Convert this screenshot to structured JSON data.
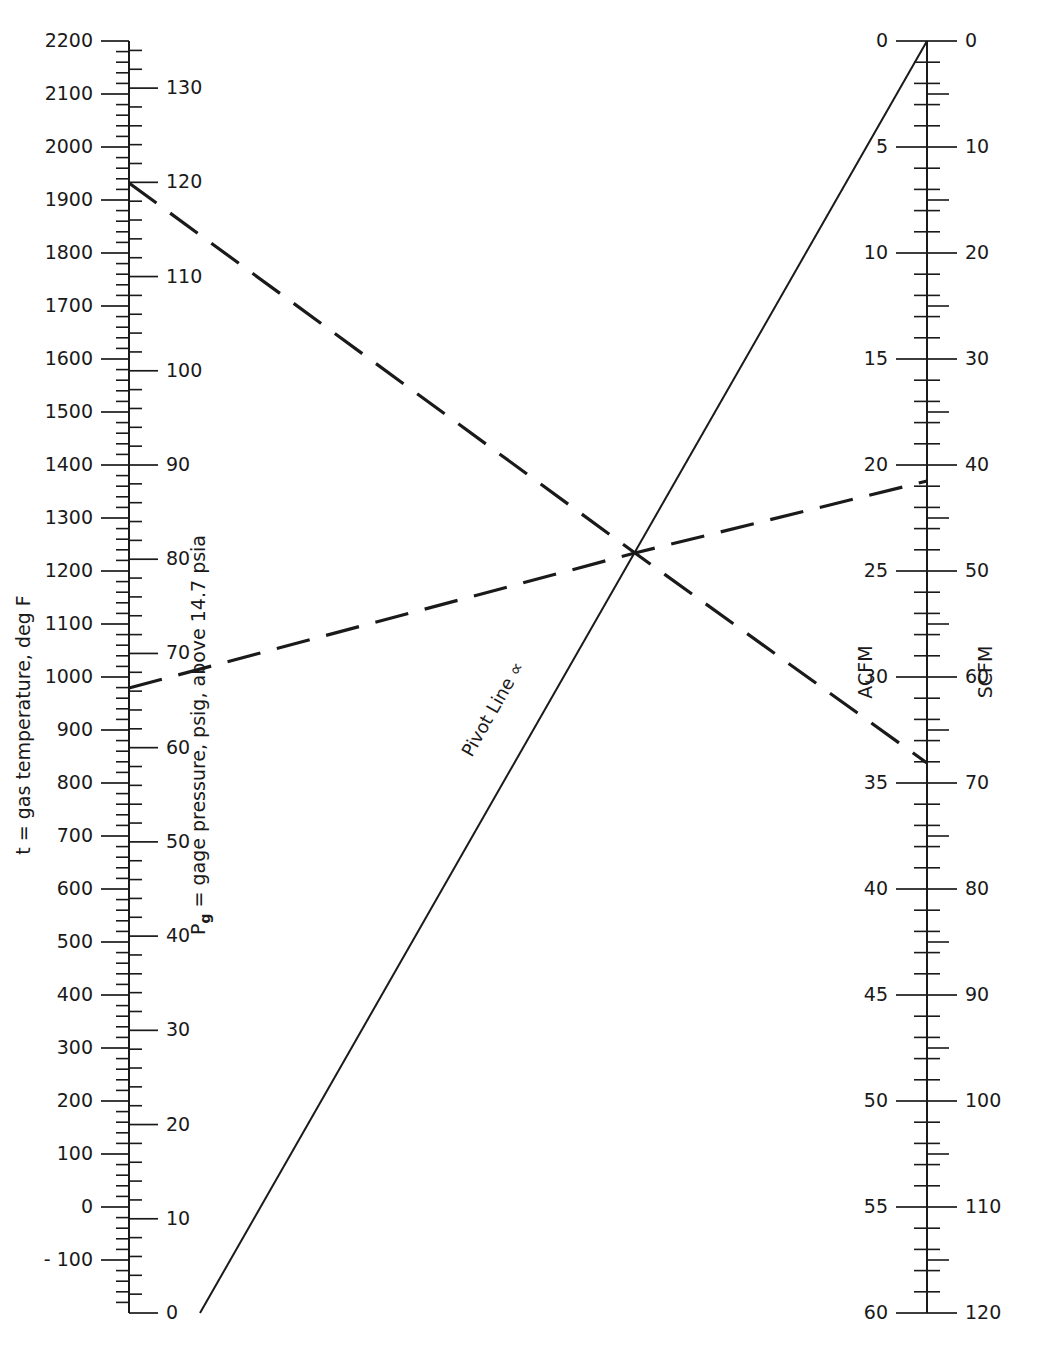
{
  "figure": {
    "kind": "nomogram",
    "background": "#ffffff",
    "ink": "#1a1a1a"
  },
  "chart_data": {
    "type": "line",
    "title": "",
    "subtitle": "",
    "xlabel": "",
    "ylabel": "",
    "grid": false,
    "legend": "none",
    "axes": [
      {
        "id": "temperature",
        "name": "t = gas temperature, deg F",
        "short": "t",
        "units": "deg F",
        "side": "left-of-left-spine",
        "orientation": "vertical",
        "min": -200,
        "max": 2200,
        "ylim": [
          -200,
          2200
        ],
        "major_step": 100,
        "minor_step": 20,
        "ticks": [
          2200,
          2100,
          2000,
          1900,
          1800,
          1700,
          1600,
          1500,
          1400,
          1300,
          1200,
          1100,
          1000,
          900,
          800,
          700,
          600,
          500,
          400,
          300,
          200,
          100,
          0,
          -100
        ],
        "tick_labels": [
          "2200",
          "2100",
          "2000",
          "1900",
          "1800",
          "1700",
          "1600",
          "1500",
          "1400",
          "1300",
          "1200",
          "1100",
          "1000",
          "900",
          "800",
          "700",
          "600",
          "500",
          "400",
          "300",
          "200",
          "100",
          "0",
          "- 100"
        ]
      },
      {
        "id": "pressure",
        "name": "Pg = gage pressure, psig, above 14.7 psia",
        "name_base": "P",
        "name_sub": "g",
        "name_rest": " = gage pressure, psig, above 14.7 psia",
        "short": "Pg",
        "units": "psig",
        "side": "right-of-left-spine",
        "orientation": "vertical",
        "min": 0,
        "max": 135,
        "ylim": [
          0,
          135
        ],
        "major_step": 10,
        "minor_step": 2,
        "ticks": [
          130,
          120,
          110,
          100,
          90,
          80,
          70,
          60,
          50,
          40,
          30,
          20,
          10,
          0
        ],
        "tick_labels": [
          "130",
          "120",
          "110",
          "100",
          "90",
          "80",
          "70",
          "60",
          "50",
          "40",
          "30",
          "20",
          "10",
          "0"
        ]
      },
      {
        "id": "acfm",
        "name": "ACFM",
        "units": "ACFM",
        "side": "left-of-right-spine",
        "orientation": "vertical",
        "min": 0,
        "max": 60,
        "ylim": [
          0,
          60
        ],
        "major_step": 5,
        "minor_step": 1,
        "ticks": [
          0,
          5,
          10,
          15,
          20,
          25,
          30,
          35,
          40,
          45,
          50,
          55,
          60
        ],
        "tick_labels": [
          "0",
          "5",
          "10",
          "15",
          "20",
          "25",
          "30",
          "35",
          "40",
          "45",
          "50",
          "55",
          "60"
        ]
      },
      {
        "id": "scfm",
        "name": "SCFM",
        "units": "SCFM",
        "side": "right-of-right-spine",
        "orientation": "vertical",
        "min": 0,
        "max": 120,
        "ylim": [
          0,
          120
        ],
        "major_step": 10,
        "minor_step": 2,
        "ticks": [
          0,
          10,
          20,
          30,
          40,
          50,
          60,
          70,
          80,
          90,
          100,
          110,
          120
        ],
        "tick_labels": [
          "0",
          "10",
          "20",
          "30",
          "40",
          "50",
          "60",
          "70",
          "80",
          "90",
          "100",
          "110",
          "120"
        ]
      }
    ],
    "series": [
      {
        "name": "Pivot Line",
        "label": "Pivot Line ∝",
        "label_text": "Pivot Line",
        "label_symbol": "∝",
        "style": "solid",
        "points": [
          {
            "x": 200,
            "y": 1313
          },
          {
            "x": 927,
            "y": 41
          }
        ]
      },
      {
        "name": "Example construction line 1 (descending)",
        "label": "",
        "style": "dashed",
        "from_scale": "temperature/pressure",
        "to_scale": "acfm/scfm",
        "reads": {
          "t": 1940,
          "Pg": 119,
          "ACFM": 34,
          "SCFM": 68
        },
        "points": [
          {
            "x": 129,
            "y": 183
          },
          {
            "x": 635,
            "y": 553
          },
          {
            "x": 927,
            "y": 763
          }
        ]
      },
      {
        "name": "Example construction line 2 (ascending)",
        "label": "",
        "style": "dashed",
        "from_scale": "temperature/pressure",
        "to_scale": "acfm/scfm",
        "reads": {
          "t": 990,
          "Pg": 67,
          "ACFM": 20.5,
          "SCFM": 41
        },
        "points": [
          {
            "x": 129,
            "y": 688
          },
          {
            "x": 635,
            "y": 553
          },
          {
            "x": 927,
            "y": 481
          }
        ]
      }
    ],
    "pivot_point": {
      "x": 635,
      "y": 553,
      "note": "common intersection of the two construction lines and the pivot line"
    }
  },
  "geometry": {
    "left_spine_x": 129,
    "right_spine_x": 927,
    "top_y": 41,
    "bottom_y": 1313,
    "temp_top_value": 2200,
    "temp_bottom_value": -200,
    "press_top_value": 135,
    "press_bottom_value": 0,
    "acfm_top_value": 0,
    "acfm_bottom_value": 60,
    "scfm_top_value": 0,
    "scfm_bottom_value": 120
  }
}
